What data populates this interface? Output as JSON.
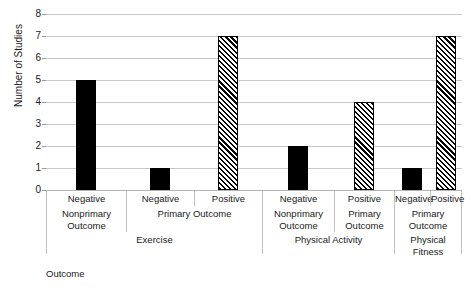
{
  "chart_data": {
    "type": "bar",
    "title": "",
    "xlabel": "",
    "ylabel": "Number of Studies",
    "ylim": [
      0,
      8
    ],
    "yticks": [
      0,
      1,
      2,
      3,
      4,
      5,
      6,
      7,
      8
    ],
    "grid": true,
    "legend": "none",
    "categories": [
      "Negative / Nonprimary Outcome / Exercise",
      "Negative / Primary Outcome / Exercise",
      "Positive / Primary Outcome / Exercise",
      "Negative / Nonprimary Outcome / Physical Activity Outcome",
      "Positive / Primary Outcome / Physical Activity Outcome",
      "Negative / Primary Outcome / Physical Fitness",
      "Positive / Primary Outcome / Physical Fitness"
    ],
    "values": [
      5,
      1,
      7,
      2,
      4,
      1,
      7
    ],
    "fills": [
      "solid",
      "solid",
      "hatch",
      "solid",
      "hatch",
      "solid",
      "hatch"
    ],
    "colors": {
      "solid": "#000000",
      "hatch_lines": "#000000",
      "hatch_bg": "#ffffff",
      "grid": "#c8c8c8"
    }
  },
  "axis": {
    "y_title": "Number of Studies",
    "y_ticks": [
      "0",
      "1",
      "2",
      "3",
      "4",
      "5",
      "6",
      "7",
      "8"
    ]
  },
  "category_table": {
    "direction_row": [
      {
        "label": "Negative",
        "left": 0,
        "width": 80
      },
      {
        "label": "Negative",
        "left": 80,
        "width": 68
      },
      {
        "label": "Positive",
        "left": 148,
        "width": 68
      },
      {
        "label": "Negative",
        "left": 216,
        "width": 72
      },
      {
        "label": "Positive",
        "left": 288,
        "width": 60
      },
      {
        "label": "Negative",
        "left": 348,
        "width": 36
      },
      {
        "label": "Positive",
        "left": 384,
        "width": 32
      }
    ],
    "outcome_row": [
      {
        "label": "Nonprimary Outcome",
        "left": 0,
        "width": 80
      },
      {
        "label": "Primary Outcome",
        "left": 80,
        "width": 136
      },
      {
        "label": "Nonprimary Outcome",
        "left": 216,
        "width": 72
      },
      {
        "label": "Primary Outcome",
        "left": 288,
        "width": 60
      },
      {
        "label": "Primary Outcome",
        "left": 348,
        "width": 68
      }
    ],
    "intervention_row": [
      {
        "label": "Exercise",
        "left": 0,
        "width": 216
      },
      {
        "label": "Physical Activity",
        "left": 216,
        "width": 132
      },
      {
        "label": "Physical Fitness",
        "left": 348,
        "width": 68
      }
    ],
    "intervention_wrap_tail": "Outcome"
  }
}
